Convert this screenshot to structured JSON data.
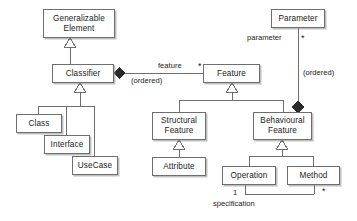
{
  "diagram": {
    "type": "uml-class-diagram",
    "background_color": "#ffffff",
    "line_color": "#6e6e6e",
    "text_color": "#222222",
    "classes": [
      {
        "id": "generalizable-element",
        "label": "Generalizable\nElement",
        "x": 43,
        "y": 9,
        "w": 72,
        "h": 29
      },
      {
        "id": "classifier",
        "label": "Classifier",
        "x": 52,
        "y": 64,
        "w": 62,
        "h": 19
      },
      {
        "id": "class",
        "label": "Class",
        "x": 16,
        "y": 114,
        "w": 46,
        "h": 19
      },
      {
        "id": "interface",
        "label": "Interface",
        "x": 44,
        "y": 135,
        "w": 46,
        "h": 19
      },
      {
        "id": "usecase",
        "label": "UseCase",
        "x": 72,
        "y": 156,
        "w": 46,
        "h": 19
      },
      {
        "id": "feature",
        "label": "Feature",
        "x": 203,
        "y": 64,
        "w": 57,
        "h": 19
      },
      {
        "id": "structural-feature",
        "label": "Structural\nFeature",
        "x": 152,
        "y": 112,
        "w": 54,
        "h": 28
      },
      {
        "id": "behavioural-feature",
        "label": "Behavioural\nFeature",
        "x": 253,
        "y": 112,
        "w": 59,
        "h": 28
      },
      {
        "id": "attribute",
        "label": "Attribute",
        "x": 152,
        "y": 157,
        "w": 54,
        "h": 19
      },
      {
        "id": "operation",
        "label": "Operation",
        "x": 222,
        "y": 166,
        "w": 54,
        "h": 19
      },
      {
        "id": "method",
        "label": "Method",
        "x": 287,
        "y": 166,
        "w": 53,
        "h": 19
      },
      {
        "id": "parameter",
        "label": "Parameter",
        "x": 271,
        "y": 9,
        "w": 54,
        "h": 19
      }
    ],
    "labels": [
      {
        "id": "feature-role",
        "text": "feature",
        "x": 158,
        "y": 62
      },
      {
        "id": "feature-multiplicity",
        "text": "*",
        "x": 198,
        "y": 62
      },
      {
        "id": "feature-ordered",
        "text": "(ordered)",
        "x": 131,
        "y": 77
      },
      {
        "id": "parameter-role",
        "text": "parameter",
        "x": 247,
        "y": 34
      },
      {
        "id": "parameter-multiplicity",
        "text": "*",
        "x": 301,
        "y": 34
      },
      {
        "id": "parameter-ordered",
        "text": "(ordered)",
        "x": 303,
        "y": 69
      },
      {
        "id": "specification-source-multiplicity",
        "text": "1",
        "x": 233,
        "y": 189
      },
      {
        "id": "specification-target-multiplicity",
        "text": "*",
        "x": 322,
        "y": 187
      },
      {
        "id": "specification-role",
        "text": "specification",
        "x": 213,
        "y": 200
      }
    ],
    "relationships": [
      {
        "id": "classifier-generalizes-to-generalizable-element",
        "kind": "generalization"
      },
      {
        "id": "class-generalizes-to-classifier",
        "kind": "generalization"
      },
      {
        "id": "interface-generalizes-to-classifier",
        "kind": "generalization"
      },
      {
        "id": "usecase-generalizes-to-classifier",
        "kind": "generalization"
      },
      {
        "id": "structural-feature-generalizes-to-feature",
        "kind": "generalization"
      },
      {
        "id": "behavioural-feature-generalizes-to-feature",
        "kind": "generalization"
      },
      {
        "id": "attribute-generalizes-to-structural-feature",
        "kind": "generalization"
      },
      {
        "id": "operation-generalizes-to-behavioural-feature",
        "kind": "generalization"
      },
      {
        "id": "method-generalizes-to-behavioural-feature",
        "kind": "generalization"
      },
      {
        "id": "classifier-composes-feature",
        "kind": "composition"
      },
      {
        "id": "behavioural-feature-composes-parameter",
        "kind": "composition"
      },
      {
        "id": "operation-specification-method",
        "kind": "association"
      }
    ]
  }
}
